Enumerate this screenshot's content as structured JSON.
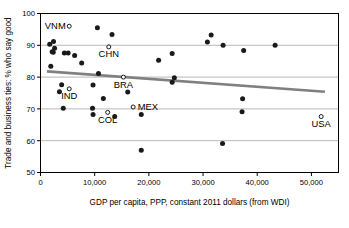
{
  "chart_data": {
    "type": "scatter",
    "title": "",
    "xlabel": "GDP per capita, PPP, constant 2011 dollars (from WDI)",
    "ylabel": "Trade and business ties: % who say good",
    "xlim": [
      0,
      55000
    ],
    "ylim": [
      50,
      100
    ],
    "xticks": [
      0,
      10000,
      20000,
      30000,
      40000,
      50000
    ],
    "xticklabels": [
      "0",
      "10,000",
      "20,000",
      "30,000",
      "40,000",
      "50,000"
    ],
    "yticks": [
      50,
      60,
      70,
      80,
      90,
      100
    ],
    "yticklabels": [
      "50",
      "60",
      "70",
      "80",
      "90",
      "100"
    ],
    "grid": "horizontal",
    "legend": "none",
    "marker_filled_color": "#1a1a1a",
    "marker_open_color": "#000000",
    "trendline_color": "#808080",
    "gridline_color": "#a6a6a6",
    "axis_color": "#000000",
    "series": [
      {
        "name": "unlabeled countries",
        "marker": "filled-circle",
        "points": [
          {
            "x": 1700,
            "y": 90.3
          },
          {
            "x": 2400,
            "y": 91.2
          },
          {
            "x": 2150,
            "y": 88.0
          },
          {
            "x": 2350,
            "y": 87.8
          },
          {
            "x": 2600,
            "y": 89.1
          },
          {
            "x": 1900,
            "y": 83.4
          },
          {
            "x": 4400,
            "y": 87.6
          },
          {
            "x": 5100,
            "y": 87.6
          },
          {
            "x": 6300,
            "y": 86.8
          },
          {
            "x": 7600,
            "y": 84.4
          },
          {
            "x": 10500,
            "y": 95.5
          },
          {
            "x": 13200,
            "y": 93.4
          },
          {
            "x": 10700,
            "y": 81.1
          },
          {
            "x": 9700,
            "y": 77.5
          },
          {
            "x": 3900,
            "y": 77.6
          },
          {
            "x": 3500,
            "y": 75.4
          },
          {
            "x": 4200,
            "y": 70.2
          },
          {
            "x": 9600,
            "y": 70.2
          },
          {
            "x": 9700,
            "y": 68.2
          },
          {
            "x": 11600,
            "y": 73.3
          },
          {
            "x": 13700,
            "y": 67.6
          },
          {
            "x": 16100,
            "y": 75.3
          },
          {
            "x": 18600,
            "y": 68.2
          },
          {
            "x": 18600,
            "y": 57.0
          },
          {
            "x": 21800,
            "y": 85.3
          },
          {
            "x": 24300,
            "y": 87.4
          },
          {
            "x": 24300,
            "y": 78.4
          },
          {
            "x": 24700,
            "y": 79.8
          },
          {
            "x": 30800,
            "y": 91.0
          },
          {
            "x": 31500,
            "y": 93.2
          },
          {
            "x": 33700,
            "y": 90.0
          },
          {
            "x": 33600,
            "y": 59.1
          },
          {
            "x": 37500,
            "y": 88.4
          },
          {
            "x": 37300,
            "y": 73.2
          },
          {
            "x": 37200,
            "y": 69.1
          },
          {
            "x": 43300,
            "y": 90.0
          }
        ]
      },
      {
        "name": "labeled countries",
        "marker": "open-circle",
        "points": [
          {
            "x": 5300,
            "y": 96.0,
            "label": "VNM",
            "label_pos": "left"
          },
          {
            "x": 12600,
            "y": 89.5,
            "label": "CHN",
            "label_pos": "below"
          },
          {
            "x": 5300,
            "y": 76.3,
            "label": "IND",
            "label_pos": "below"
          },
          {
            "x": 15300,
            "y": 80.0,
            "label": "BRA",
            "label_pos": "below"
          },
          {
            "x": 17100,
            "y": 70.6,
            "label": "MEX",
            "label_pos": "right"
          },
          {
            "x": 12400,
            "y": 68.9,
            "label": "COL",
            "label_pos": "below"
          },
          {
            "x": 51800,
            "y": 67.6,
            "label": "USA",
            "label_pos": "below"
          }
        ]
      }
    ],
    "trendline": {
      "name": "linear-fit",
      "x_start": 1200,
      "y_start": 81.8,
      "x_end": 52500,
      "y_end": 75.4
    }
  }
}
